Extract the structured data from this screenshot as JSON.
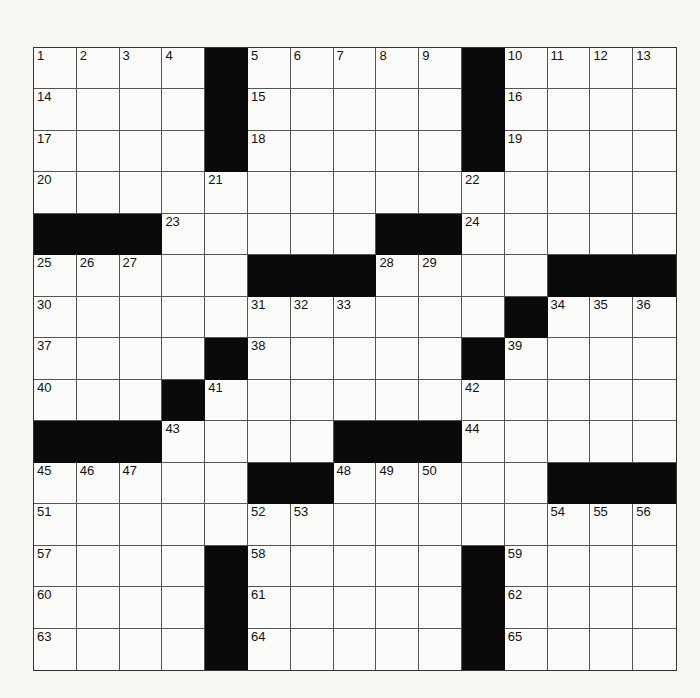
{
  "puzzle": {
    "rows": 15,
    "cols": 15,
    "black_cells": [
      [
        0,
        4
      ],
      [
        0,
        10
      ],
      [
        1,
        4
      ],
      [
        1,
        10
      ],
      [
        2,
        4
      ],
      [
        2,
        10
      ],
      [
        4,
        0
      ],
      [
        4,
        1
      ],
      [
        4,
        2
      ],
      [
        4,
        8
      ],
      [
        4,
        9
      ],
      [
        5,
        5
      ],
      [
        5,
        6
      ],
      [
        5,
        7
      ],
      [
        5,
        12
      ],
      [
        5,
        13
      ],
      [
        5,
        14
      ],
      [
        6,
        11
      ],
      [
        7,
        4
      ],
      [
        7,
        10
      ],
      [
        8,
        3
      ],
      [
        9,
        0
      ],
      [
        9,
        1
      ],
      [
        9,
        2
      ],
      [
        9,
        7
      ],
      [
        9,
        8
      ],
      [
        9,
        9
      ],
      [
        10,
        5
      ],
      [
        10,
        6
      ],
      [
        10,
        12
      ],
      [
        10,
        13
      ],
      [
        10,
        14
      ],
      [
        12,
        4
      ],
      [
        12,
        10
      ],
      [
        13,
        4
      ],
      [
        13,
        10
      ],
      [
        14,
        4
      ],
      [
        14,
        10
      ]
    ],
    "numbers": [
      {
        "r": 0,
        "c": 0,
        "n": "1"
      },
      {
        "r": 0,
        "c": 1,
        "n": "2"
      },
      {
        "r": 0,
        "c": 2,
        "n": "3"
      },
      {
        "r": 0,
        "c": 3,
        "n": "4"
      },
      {
        "r": 0,
        "c": 5,
        "n": "5"
      },
      {
        "r": 0,
        "c": 6,
        "n": "6"
      },
      {
        "r": 0,
        "c": 7,
        "n": "7"
      },
      {
        "r": 0,
        "c": 8,
        "n": "8"
      },
      {
        "r": 0,
        "c": 9,
        "n": "9"
      },
      {
        "r": 0,
        "c": 11,
        "n": "10"
      },
      {
        "r": 0,
        "c": 12,
        "n": "11"
      },
      {
        "r": 0,
        "c": 13,
        "n": "12"
      },
      {
        "r": 0,
        "c": 14,
        "n": "13"
      },
      {
        "r": 1,
        "c": 0,
        "n": "14"
      },
      {
        "r": 1,
        "c": 5,
        "n": "15"
      },
      {
        "r": 1,
        "c": 11,
        "n": "16"
      },
      {
        "r": 2,
        "c": 0,
        "n": "17"
      },
      {
        "r": 2,
        "c": 5,
        "n": "18"
      },
      {
        "r": 2,
        "c": 11,
        "n": "19"
      },
      {
        "r": 3,
        "c": 0,
        "n": "20"
      },
      {
        "r": 3,
        "c": 4,
        "n": "21"
      },
      {
        "r": 3,
        "c": 10,
        "n": "22"
      },
      {
        "r": 4,
        "c": 3,
        "n": "23"
      },
      {
        "r": 4,
        "c": 10,
        "n": "24"
      },
      {
        "r": 5,
        "c": 0,
        "n": "25"
      },
      {
        "r": 5,
        "c": 1,
        "n": "26"
      },
      {
        "r": 5,
        "c": 2,
        "n": "27"
      },
      {
        "r": 5,
        "c": 8,
        "n": "28"
      },
      {
        "r": 5,
        "c": 9,
        "n": "29"
      },
      {
        "r": 6,
        "c": 0,
        "n": "30"
      },
      {
        "r": 6,
        "c": 5,
        "n": "31"
      },
      {
        "r": 6,
        "c": 6,
        "n": "32"
      },
      {
        "r": 6,
        "c": 7,
        "n": "33"
      },
      {
        "r": 6,
        "c": 12,
        "n": "34"
      },
      {
        "r": 6,
        "c": 13,
        "n": "35"
      },
      {
        "r": 6,
        "c": 14,
        "n": "36"
      },
      {
        "r": 7,
        "c": 0,
        "n": "37"
      },
      {
        "r": 7,
        "c": 5,
        "n": "38"
      },
      {
        "r": 7,
        "c": 11,
        "n": "39"
      },
      {
        "r": 8,
        "c": 0,
        "n": "40"
      },
      {
        "r": 8,
        "c": 4,
        "n": "41"
      },
      {
        "r": 8,
        "c": 10,
        "n": "42"
      },
      {
        "r": 9,
        "c": 3,
        "n": "43"
      },
      {
        "r": 9,
        "c": 10,
        "n": "44"
      },
      {
        "r": 10,
        "c": 0,
        "n": "45"
      },
      {
        "r": 10,
        "c": 1,
        "n": "46"
      },
      {
        "r": 10,
        "c": 2,
        "n": "47"
      },
      {
        "r": 10,
        "c": 7,
        "n": "48"
      },
      {
        "r": 10,
        "c": 8,
        "n": "49"
      },
      {
        "r": 10,
        "c": 9,
        "n": "50"
      },
      {
        "r": 11,
        "c": 0,
        "n": "51"
      },
      {
        "r": 11,
        "c": 5,
        "n": "52"
      },
      {
        "r": 11,
        "c": 6,
        "n": "53"
      },
      {
        "r": 11,
        "c": 12,
        "n": "54"
      },
      {
        "r": 11,
        "c": 13,
        "n": "55"
      },
      {
        "r": 11,
        "c": 14,
        "n": "56"
      },
      {
        "r": 12,
        "c": 0,
        "n": "57"
      },
      {
        "r": 12,
        "c": 5,
        "n": "58"
      },
      {
        "r": 12,
        "c": 11,
        "n": "59"
      },
      {
        "r": 13,
        "c": 0,
        "n": "60"
      },
      {
        "r": 13,
        "c": 5,
        "n": "61"
      },
      {
        "r": 13,
        "c": 11,
        "n": "62"
      },
      {
        "r": 14,
        "c": 0,
        "n": "63"
      },
      {
        "r": 14,
        "c": 5,
        "n": "64"
      },
      {
        "r": 14,
        "c": 11,
        "n": "65"
      }
    ]
  }
}
